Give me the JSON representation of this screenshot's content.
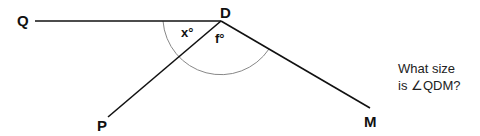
{
  "diagram": {
    "points": {
      "Q": {
        "label": "Q",
        "x": 35,
        "y": 21
      },
      "D": {
        "label": "D",
        "x": 221,
        "y": 21
      },
      "P": {
        "label": "P",
        "x": 108,
        "y": 117
      },
      "M": {
        "label": "M",
        "x": 376,
        "y": 116
      }
    },
    "angles": {
      "x": {
        "label": "x°"
      },
      "f": {
        "label": "f°"
      }
    },
    "line_color": "#111111",
    "arc_color": "#888888"
  },
  "question": {
    "line1": "What size",
    "line2": "is ∠QDM?"
  }
}
